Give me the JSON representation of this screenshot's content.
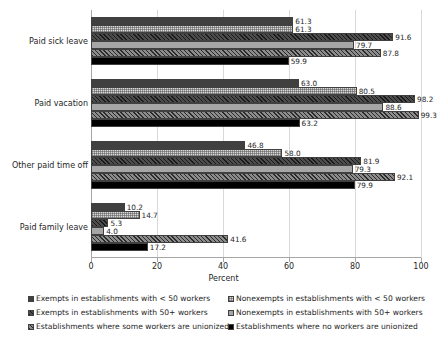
{
  "chart_data": {
    "type": "bar",
    "orientation": "horizontal",
    "title": "",
    "xlabel": "Percent",
    "ylabel": "",
    "xlim": [
      0,
      100
    ],
    "xticks": [
      0,
      20,
      40,
      60,
      80,
      100
    ],
    "grid": true,
    "legend_position": "bottom",
    "categories": [
      "Paid sick leave",
      "Paid vacation",
      "Other paid time off",
      "Paid family leave"
    ],
    "series": [
      {
        "name": "Exempts in establishments with < 50 workers",
        "pattern": "solid-dark-gray",
        "values": [
          61.3,
          63.0,
          46.8,
          10.2
        ]
      },
      {
        "name": "Nonexempts in establishments with < 50 workers",
        "pattern": "light-gray-checkered",
        "values": [
          61.3,
          80.5,
          58.0,
          14.7
        ]
      },
      {
        "name": "Exempts in establishments with 50+ workers",
        "pattern": "dark-diagonal-hatch",
        "values": [
          91.6,
          98.2,
          81.9,
          5.3
        ]
      },
      {
        "name": "Nonexempts in establishments with 50+ workers",
        "pattern": "solid-medium-gray",
        "values": [
          79.7,
          88.6,
          79.3,
          4.0
        ]
      },
      {
        "name": "Establishments where some workers are unionized",
        "pattern": "medium-diagonal-hatch",
        "values": [
          87.8,
          99.3,
          92.1,
          41.6
        ]
      },
      {
        "name": "Establishments where no workers are unionized",
        "pattern": "solid-black",
        "values": [
          59.9,
          63.2,
          79.9,
          17.2
        ]
      }
    ],
    "data_labels": [
      [
        "61.3",
        "61.3",
        "91.6",
        "79.7",
        "87.8",
        "59.9"
      ],
      [
        "63.0",
        "80.5",
        "98.2",
        "88.6",
        "99.3",
        "63.2"
      ],
      [
        "46.8",
        "58.0",
        "81.9",
        "79.3",
        "92.1",
        "79.9"
      ],
      [
        "10.2",
        "14.7",
        "5.3",
        "4.0",
        "41.6",
        "17.2"
      ]
    ],
    "xtick_labels": [
      "0",
      "20",
      "40",
      "60",
      "80",
      "100"
    ]
  },
  "legend": {
    "items": [
      {
        "label": "Exempts in establishments with < 50 workers",
        "pattern": "solid-dark-gray"
      },
      {
        "label": "Nonexempts in establishments with < 50 workers",
        "pattern": "light-gray-checkered"
      },
      {
        "label": "Exempts in establishments with 50+ workers",
        "pattern": "dark-diagonal-hatch"
      },
      {
        "label": "Nonexempts in establishments with 50+ workers",
        "pattern": "solid-medium-gray"
      },
      {
        "label": "Establishments where some workers are unionized",
        "pattern": "medium-diagonal-hatch"
      },
      {
        "label": "Establishments where no workers are unionized",
        "pattern": "solid-black"
      }
    ]
  },
  "colors": {
    "series_0": "#404040",
    "series_1": "#d9d9d9",
    "series_2": "#4d4d4d",
    "series_3": "#a6a6a6",
    "series_4": "#8c8c8c",
    "series_5": "#000000",
    "grid": "#d9d9d9",
    "axis": "#a6a6a6",
    "text": "#262626"
  }
}
